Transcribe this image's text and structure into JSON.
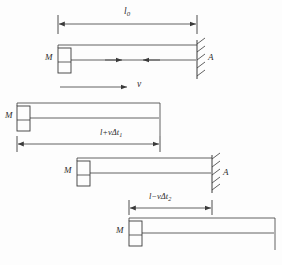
{
  "figure": {
    "background_color": "#fdfdfd",
    "line_color": "#3a3a3a",
    "text_color": "#2c2c2c"
  },
  "panels": [
    {
      "id": "panel-rest",
      "dimension_label_main": "l",
      "dimension_label_sub": "0",
      "mass_label": "M",
      "wall_label": "A",
      "has_wall": true,
      "has_internal_arrows": true,
      "dimension": {
        "x1": 58,
        "x2": 197,
        "y": 24
      },
      "rod": {
        "x1": 58,
        "x2": 197,
        "y_top": 45,
        "y_mid": 60,
        "y_bot": 62
      },
      "block": {
        "x": 58,
        "y": 48,
        "w": 13,
        "h": 25
      },
      "wall": {
        "x": 197,
        "y_top": 40,
        "y_bot": 78
      }
    },
    {
      "id": "panel-velocity",
      "velocity_label": "v",
      "arrow": {
        "x1": 60,
        "x2": 128,
        "y": 87
      }
    },
    {
      "id": "panel-expanded",
      "dimension_label_main": "l+vΔt",
      "dimension_label_sub": "1",
      "mass_label": "M",
      "has_wall": false,
      "dimension": {
        "x1": 17,
        "x2": 160,
        "y": 144
      },
      "rod": {
        "x1": 17,
        "x2": 160,
        "y_top": 103,
        "y_mid": 118,
        "y_bot": 120
      },
      "block": {
        "x": 17,
        "y": 106,
        "w": 13,
        "h": 25
      }
    },
    {
      "id": "panel-contact",
      "mass_label": "M",
      "wall_label": "A",
      "has_wall": true,
      "rod": {
        "x1": 77,
        "x2": 212,
        "y_top": 158,
        "y_mid": 173,
        "y_bot": 175
      },
      "block": {
        "x": 77,
        "y": 161,
        "w": 13,
        "h": 25
      },
      "wall": {
        "x": 212,
        "y_top": 155,
        "y_bot": 192
      }
    },
    {
      "id": "panel-contracted",
      "dimension_label_main": "l−vΔt",
      "dimension_label_sub": "2",
      "mass_label": "M",
      "has_wall": false,
      "dimension": {
        "x1": 129,
        "x2": 212,
        "y": 208
      },
      "rod": {
        "x1": 129,
        "x2": 275,
        "y_top": 218,
        "y_mid": 233,
        "y_bot": 235
      },
      "block": {
        "x": 129,
        "y": 221,
        "w": 13,
        "h": 25
      }
    }
  ],
  "labels": {
    "l0_main": "l",
    "l0_sub": "0",
    "M1": "M",
    "A1": "A",
    "v": "v",
    "dim2_main": "l+vΔt",
    "dim2_sub": "1",
    "M2": "M",
    "M3": "M",
    "A2": "A",
    "dim3_main": "l−vΔt",
    "dim3_sub": "2",
    "M4": "M"
  }
}
